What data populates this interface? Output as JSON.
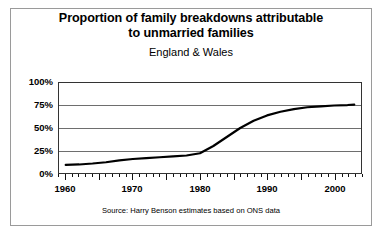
{
  "chart_data": {
    "type": "line",
    "title": "Proportion of family breakdowns attributable to unmarried families",
    "title_lines": [
      "Proportion of family breakdowns attributable",
      "to unmarried families"
    ],
    "subtitle": "England & Wales",
    "source": "Source: Harry Benson estimates based on ONS data",
    "xlabel": "",
    "ylabel": "",
    "xlim": [
      1959,
      2004
    ],
    "ylim": [
      0,
      100
    ],
    "grid": true,
    "legend": "none",
    "x_tick_labels": [
      "1960",
      "1970",
      "1980",
      "1990",
      "2000"
    ],
    "x_major_ticks": [
      1960,
      1965,
      1970,
      1975,
      1980,
      1985,
      1990,
      1995,
      2000
    ],
    "x_minor_tick_interval": 1,
    "y_tick_labels": [
      "100%",
      "75%",
      "50%",
      "25%",
      "0%"
    ],
    "y_ticks": [
      100,
      75,
      50,
      25,
      0
    ],
    "series": [
      {
        "name": "Proportion of family breakdowns attributable to unmarried families",
        "color": "#000000",
        "x": [
          1960,
          1962,
          1964,
          1966,
          1968,
          1970,
          1972,
          1974,
          1976,
          1978,
          1980,
          1982,
          1984,
          1986,
          1988,
          1990,
          1992,
          1994,
          1996,
          1998,
          2000,
          2002,
          2003
        ],
        "values": [
          9,
          9.5,
          10.5,
          12,
          14,
          15.5,
          16.5,
          17.5,
          18.5,
          19.5,
          22,
          30,
          40,
          50,
          58,
          64,
          68,
          71,
          73,
          74,
          75,
          75.5,
          76
        ]
      }
    ]
  }
}
